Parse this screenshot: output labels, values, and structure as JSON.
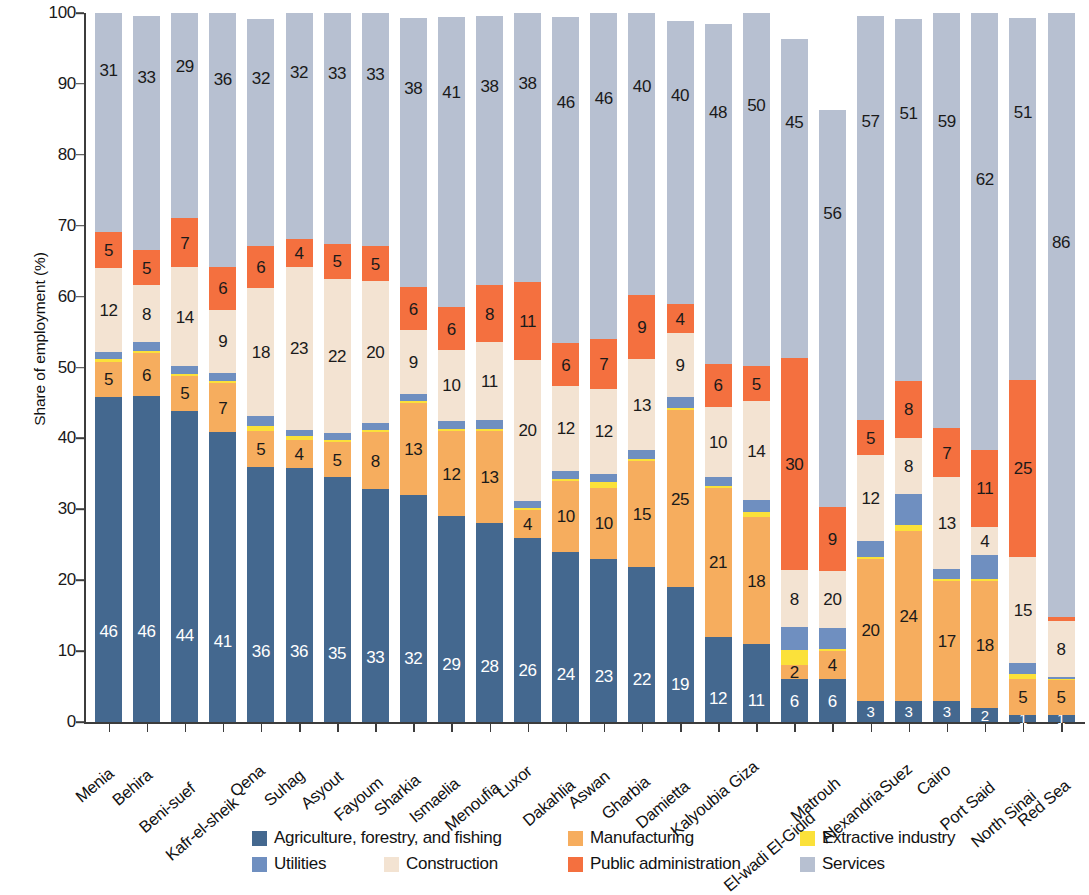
{
  "chart_data": {
    "type": "bar",
    "subtype": "stacked-bar-100-percent",
    "title": "",
    "xlabel": "",
    "ylabel": "Share of employment (%)",
    "ylim": [
      0,
      100
    ],
    "yticks": [
      0,
      10,
      20,
      30,
      40,
      50,
      60,
      70,
      80,
      90,
      100
    ],
    "grid": false,
    "legend_position": "bottom",
    "stack_order_bottom_to_top": [
      "Agriculture, forestry, and fishing",
      "Manufacturing",
      "Extractive industry",
      "Utilities",
      "Construction",
      "Public administration",
      "Services"
    ],
    "colors": {
      "agriculture": "#44688f",
      "manufacturing": "#f6ad5e",
      "extractive": "#fbe13a",
      "utilities": "#6f8fc0",
      "construction": "#f3e3d2",
      "public_administration": "#f4703f",
      "services": "#b7c0d1"
    },
    "categories": [
      "Menia",
      "Behira",
      "Beni-suef",
      "Kafr-el-sheik",
      "Qena",
      "Suhag",
      "Asyout",
      "Fayoum",
      "Sharkia",
      "Ismaelia",
      "Menoufia",
      "Luxor",
      "Dakahlia",
      "Aswan",
      "Gharbia",
      "Damietta",
      "Kalyoubia",
      "Giza",
      "El-wadi El-Gidid",
      "Matrouh",
      "Alexandria",
      "Suez",
      "Cairo",
      "Port Said",
      "North Sinai",
      "Red Sea"
    ],
    "series": [
      {
        "name": "Agriculture, forestry, and fishing",
        "key": "agriculture",
        "values": [
          46,
          46,
          44,
          41,
          36,
          36,
          35,
          33,
          32,
          29,
          28,
          26,
          24,
          23,
          22,
          19,
          12,
          11,
          6,
          6,
          3,
          3,
          3,
          2,
          1,
          1
        ]
      },
      {
        "name": "Manufacturing",
        "key": "manufacturing",
        "values": [
          5,
          6,
          5,
          7,
          5,
          4,
          5,
          8,
          13,
          12,
          13,
          4,
          10,
          10,
          15,
          25,
          21,
          18,
          2,
          4,
          20,
          24,
          17,
          18,
          5,
          5
        ]
      },
      {
        "name": "Extractive industry",
        "key": "extractive",
        "values": [
          0.4,
          0.4,
          0.3,
          0.3,
          0.8,
          0.5,
          0.4,
          0.4,
          0.3,
          0.3,
          0.3,
          0.3,
          0.3,
          0.8,
          0.3,
          0.3,
          0.3,
          0.8,
          2.2,
          0.3,
          0.3,
          0.8,
          0.3,
          0.3,
          0.8,
          0.2
        ]
      },
      {
        "name": "Utilities",
        "key": "utilities",
        "values": [
          0.9,
          1.2,
          1.0,
          1.1,
          1.4,
          0.9,
          1.0,
          1.0,
          1.0,
          1.2,
          1.3,
          0.9,
          1.1,
          1.2,
          1.2,
          1.6,
          1.2,
          1.6,
          3.2,
          3.0,
          2.3,
          4.3,
          1.5,
          3.4,
          1.5,
          0.2
        ]
      },
      {
        "name": "Construction",
        "key": "construction",
        "values": [
          12,
          8,
          14,
          9,
          18,
          23,
          22,
          20,
          9,
          10,
          11,
          20,
          12,
          12,
          13,
          9,
          10,
          14,
          8,
          8,
          12,
          8,
          13,
          4,
          15,
          8
        ]
      },
      {
        "name": "Public administration",
        "key": "public_administration",
        "values": [
          5,
          5,
          7,
          6,
          6,
          4,
          5,
          5,
          6,
          6,
          8,
          11,
          6,
          7,
          9,
          4,
          6,
          5,
          30,
          9,
          5,
          8,
          7,
          11,
          25,
          0.6
        ]
      },
      {
        "name": "Services",
        "key": "services",
        "values": [
          31,
          33,
          29,
          36,
          32,
          32,
          33,
          33,
          38,
          41,
          38,
          38,
          46,
          46,
          40,
          40,
          48,
          50,
          45,
          56,
          57,
          51,
          59,
          62,
          51,
          86
        ]
      }
    ],
    "data_labels": {
      "note": "Labels shown only where segment is wide enough",
      "agriculture": [
        "46",
        "46",
        "44",
        "41",
        "36",
        "36",
        "35",
        "33",
        "32",
        "29",
        "28",
        "26",
        "24",
        "23",
        "22",
        "19",
        "12",
        "11",
        "6",
        "6",
        "3",
        "3",
        "3",
        "2",
        "1",
        "1"
      ],
      "manufacturing": [
        "5",
        "6",
        "5",
        "7",
        "5",
        "4",
        "5",
        "8",
        "13",
        "12",
        "13",
        "4",
        "10",
        "10",
        "15",
        "25",
        "21",
        "18",
        "2",
        "4",
        "20",
        "24",
        "17",
        "18",
        "5",
        "5"
      ],
      "extractive": [
        "",
        "",
        "",
        "",
        "",
        "",
        "",
        "",
        "",
        "",
        "",
        "",
        "",
        "",
        "",
        "",
        "",
        "",
        "",
        "",
        "",
        "",
        "",
        "",
        "",
        ""
      ],
      "utilities": [
        "",
        "",
        "",
        "",
        "",
        "",
        "",
        "",
        "",
        "",
        "",
        "",
        "",
        "",
        "",
        "",
        "",
        "",
        "",
        "",
        "",
        "",
        "",
        "",
        "",
        ""
      ],
      "construction": [
        "12",
        "8",
        "14",
        "9",
        "18",
        "23",
        "22",
        "20",
        "9",
        "10",
        "11",
        "20",
        "12",
        "12",
        "13",
        "9",
        "10",
        "14",
        "8",
        "20",
        "12",
        "8",
        "13",
        "4",
        "15",
        "8"
      ],
      "public_administration": [
        "5",
        "5",
        "7",
        "6",
        "6",
        "4",
        "5",
        "5",
        "6",
        "6",
        "8",
        "11",
        "6",
        "7",
        "9",
        "4",
        "6",
        "5",
        "30",
        "9",
        "5",
        "8",
        "7",
        "11",
        "25",
        ""
      ],
      "services": [
        "31",
        "33",
        "29",
        "36",
        "32",
        "32",
        "33",
        "33",
        "38",
        "41",
        "38",
        "38",
        "46",
        "46",
        "40",
        "40",
        "48",
        "50",
        "45",
        "56",
        "57",
        "51",
        "59",
        "62",
        "51",
        "86"
      ]
    }
  },
  "legend": {
    "row1": [
      {
        "label": "Agriculture, forestry, and fishing",
        "color": "#44688f"
      },
      {
        "label": "Manufacturing",
        "color": "#f6ad5e"
      },
      {
        "label": "Extractive industry",
        "color": "#fbe13a"
      }
    ],
    "row2": [
      {
        "label": "Utilities",
        "color": "#6f8fc0"
      },
      {
        "label": "Construction",
        "color": "#f3e3d2"
      },
      {
        "label": "Public administration",
        "color": "#f4703f"
      },
      {
        "label": "Services",
        "color": "#b7c0d1"
      }
    ]
  }
}
